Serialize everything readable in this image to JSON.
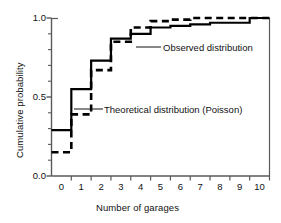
{
  "figure": {
    "xlabel": "Number of garages",
    "ylabel": "Cumulative probability"
  },
  "annotations": {
    "observed": "Observed distribution",
    "theoretical": "Theoretical distribution (Poisson)"
  },
  "axes": {
    "y_ticks": [
      "0.0",
      "0.5",
      "1.0"
    ],
    "x_ticks": [
      "0",
      "1",
      "2",
      "3",
      "4",
      "5",
      "6",
      "7",
      "8",
      "9",
      "10"
    ]
  },
  "colors": {
    "line": "#000000",
    "axis": "#5a5a5a",
    "background": "#ffffff"
  },
  "chart_data": {
    "type": "line",
    "title": "",
    "xlabel": "Number of garages",
    "ylabel": "Cumulative probability",
    "xlim": [
      -0.5,
      10.5
    ],
    "ylim": [
      0.0,
      1.0
    ],
    "grid": false,
    "legend_position": "inline-annotations",
    "categories": [
      0,
      1,
      2,
      3,
      4,
      5,
      6,
      7,
      8,
      9,
      10
    ],
    "series": [
      {
        "name": "Observed distribution",
        "style": "solid",
        "values": [
          0.29,
          0.55,
          0.73,
          0.87,
          0.9,
          0.94,
          0.95,
          0.96,
          0.97,
          0.97,
          1.0
        ]
      },
      {
        "name": "Theoretical distribution (Poisson)",
        "style": "dashed",
        "values": [
          0.15,
          0.39,
          0.67,
          0.85,
          0.94,
          0.98,
          0.99,
          1.0,
          1.0,
          1.0,
          1.0
        ]
      }
    ]
  }
}
